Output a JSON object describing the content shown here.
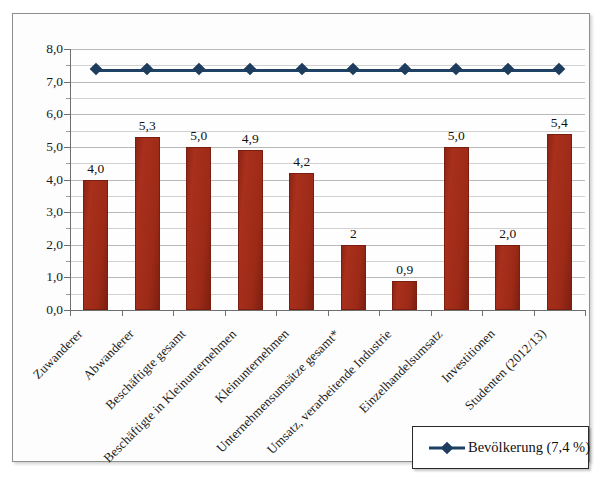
{
  "chart_data": {
    "type": "bar",
    "title": "",
    "subtitle": "",
    "xlabel": "",
    "ylabel": "",
    "ylim": [
      0,
      8
    ],
    "y_major_step": 1,
    "y_minor_step": 0.5,
    "grid": true,
    "decimal_separator": ",",
    "legend_position": "bottom-right",
    "categories": [
      "Zuwanderer",
      "Abwanderer",
      "Beschäftigte gesamt",
      "Beschäftigte in Kleinunternehmen",
      "Kleinunternehmen",
      "Unternehmensumsätze gesamt*",
      "Umsatz, verarbeitende Industrie",
      "Einzelhandelsumsatz",
      "Investitionen",
      "Studenten (2012/13)"
    ],
    "y_tick_labels": [
      "0,0",
      "1,0",
      "2,0",
      "3,0",
      "4,0",
      "5,0",
      "6,0",
      "7,0",
      "8,0"
    ],
    "series": [
      {
        "name": "Anteil",
        "type": "bar",
        "color": "#9c2a17",
        "values": [
          4.0,
          5.3,
          5.0,
          4.9,
          4.2,
          2.0,
          0.9,
          5.0,
          2.0,
          5.4
        ],
        "data_labels": [
          "4,0",
          "5,3",
          "5,0",
          "4,9",
          "4,2",
          "2",
          "0,9",
          "5,0",
          "2,0",
          "5,4"
        ]
      },
      {
        "name": "Bevölkerung (7,4 %)",
        "type": "line",
        "color": "#1f4163",
        "marker": "diamond",
        "constant_value": 7.4,
        "values": [
          7.4,
          7.4,
          7.4,
          7.4,
          7.4,
          7.4,
          7.4,
          7.4,
          7.4,
          7.4
        ]
      }
    ],
    "legend": [
      {
        "label": "Bevölkerung (7,4 %)",
        "color": "#1f4163",
        "marker": "diamond"
      }
    ],
    "footnote_marker": "*"
  },
  "colors": {
    "bar": "#9c2a17",
    "line": "#1f4163",
    "frame": "#8e8e8e",
    "axis": "#6e6e6e",
    "gridline": "#b9b9b9",
    "background": "#fdfdfd"
  }
}
